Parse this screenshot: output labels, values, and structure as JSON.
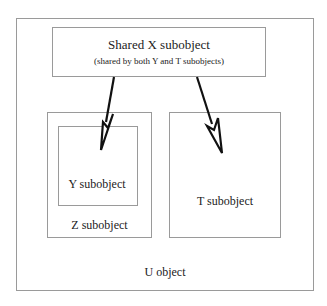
{
  "diagram": {
    "outer": {
      "label": "U object"
    },
    "shared": {
      "title": "Shared X subobject",
      "subtitle": "(shared by both Y and T subobjects)"
    },
    "z": {
      "label": "Z subobject"
    },
    "y": {
      "label": "Y subobject"
    },
    "t": {
      "label": "T subobject"
    },
    "arrows": [
      {
        "from": "shared",
        "to": "y"
      },
      {
        "from": "shared",
        "to": "t"
      }
    ],
    "colors": {
      "border": "#9a9a9a",
      "arrow": "#111111",
      "text": "#222222"
    }
  }
}
